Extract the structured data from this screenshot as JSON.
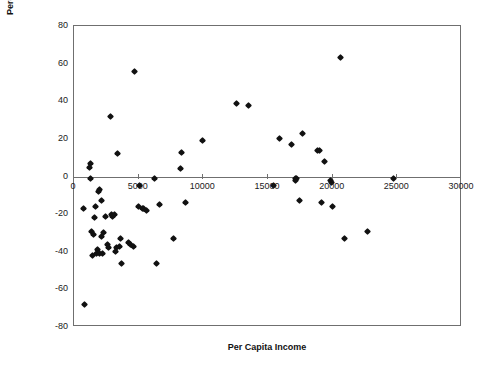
{
  "chart_data": {
    "type": "scatter",
    "title": "",
    "xlabel": "Per Capita Income",
    "ylabel": "Percentage Change in the Terms of Trade, 1980–93",
    "xlim": [
      0,
      30000
    ],
    "ylim": [
      -80,
      80
    ],
    "xticks": [
      0,
      5000,
      10000,
      15000,
      20000,
      25000,
      30000
    ],
    "xticklabels": [
      "0",
      "5000",
      "10000",
      "15000",
      "20000",
      "25000",
      "30000"
    ],
    "yticks": [
      -80,
      -60,
      -40,
      -20,
      0,
      20,
      40,
      60,
      80
    ],
    "yticklabels": [
      "-80",
      "-60",
      "-40",
      "-20",
      "0",
      "20",
      "40",
      "60",
      "80"
    ],
    "grid": false,
    "legend": null,
    "marker": "diamond",
    "marker_color": "#111111",
    "frame_color": "#6f6f6f",
    "background": "#ffffff",
    "series": [
      {
        "name": "Countries",
        "points": [
          [
            700,
            -17
          ],
          [
            800,
            -68
          ],
          [
            1200,
            5
          ],
          [
            1250,
            7
          ],
          [
            1300,
            -1
          ],
          [
            1350,
            -29
          ],
          [
            1400,
            -42
          ],
          [
            1500,
            -31
          ],
          [
            1600,
            -22
          ],
          [
            1700,
            -16
          ],
          [
            1750,
            -41
          ],
          [
            1800,
            -39
          ],
          [
            1900,
            -8
          ],
          [
            1950,
            -7
          ],
          [
            2000,
            -41
          ],
          [
            2100,
            -32
          ],
          [
            2150,
            -13
          ],
          [
            2200,
            -41
          ],
          [
            2250,
            -30
          ],
          [
            2400,
            -21
          ],
          [
            2600,
            -36
          ],
          [
            2700,
            -38
          ],
          [
            2800,
            32
          ],
          [
            2900,
            -20
          ],
          [
            3000,
            -21
          ],
          [
            3100,
            -20
          ],
          [
            3200,
            -40
          ],
          [
            3300,
            -38
          ],
          [
            3400,
            12
          ],
          [
            3500,
            -37
          ],
          [
            3600,
            -33
          ],
          [
            3700,
            -46
          ],
          [
            4200,
            -35
          ],
          [
            4400,
            -36
          ],
          [
            4600,
            -37
          ],
          [
            4700,
            56
          ],
          [
            5000,
            -16
          ],
          [
            5100,
            -5
          ],
          [
            5300,
            -17
          ],
          [
            5400,
            -17
          ],
          [
            5600,
            -18
          ],
          [
            6200,
            -1
          ],
          [
            6400,
            -46
          ],
          [
            6600,
            -15
          ],
          [
            7700,
            -33
          ],
          [
            8200,
            4
          ],
          [
            8300,
            13
          ],
          [
            8600,
            -14
          ],
          [
            9900,
            19
          ],
          [
            12600,
            39
          ],
          [
            13500,
            38
          ],
          [
            15400,
            -5
          ],
          [
            15900,
            20
          ],
          [
            16800,
            17
          ],
          [
            17100,
            -1
          ],
          [
            17150,
            -2
          ],
          [
            17200,
            -1
          ],
          [
            17400,
            -13
          ],
          [
            17700,
            23
          ],
          [
            18800,
            14
          ],
          [
            19000,
            14
          ],
          [
            19100,
            -14
          ],
          [
            19400,
            8
          ],
          [
            19800,
            -2
          ],
          [
            19900,
            -3
          ],
          [
            20000,
            -16
          ],
          [
            20600,
            63
          ],
          [
            20900,
            -33
          ],
          [
            22700,
            -29
          ],
          [
            24700,
            -1
          ]
        ]
      }
    ]
  },
  "axes": {
    "x_title": "Per Capita Income",
    "y_title": "Percentage Change in the Terms of Trade, 1980–93"
  }
}
